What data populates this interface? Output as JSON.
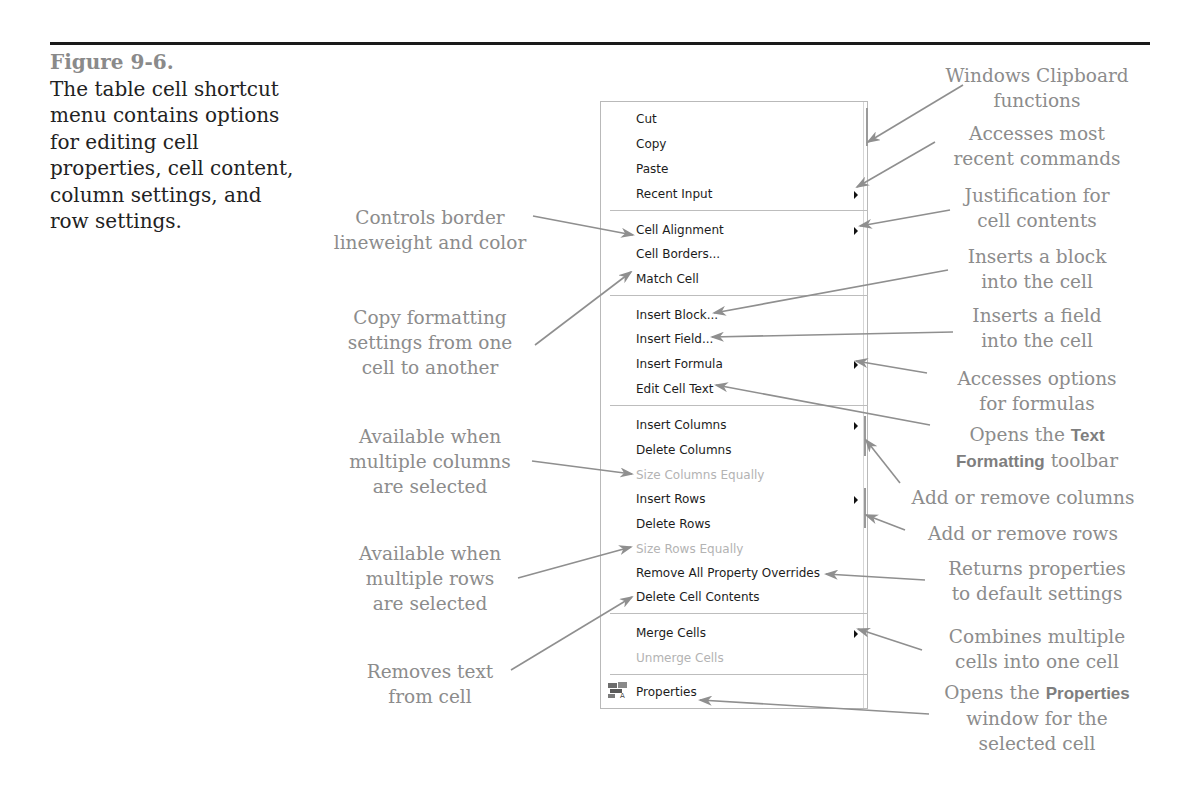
{
  "figure": {
    "label": "Figure 9-6.",
    "caption": "The table cell shortcut menu contains options for editing cell properties, cell content, column settings, and row settings."
  },
  "menu": {
    "items": [
      {
        "label": "Cut",
        "enabled": true,
        "submenu": false
      },
      {
        "label": "Copy",
        "enabled": true,
        "submenu": false
      },
      {
        "label": "Paste",
        "enabled": true,
        "submenu": false
      },
      {
        "label": "Recent Input",
        "enabled": true,
        "submenu": true
      },
      {
        "label": "Cell Alignment",
        "enabled": true,
        "submenu": true
      },
      {
        "label": "Cell Borders...",
        "enabled": true,
        "submenu": false
      },
      {
        "label": "Match Cell",
        "enabled": true,
        "submenu": false
      },
      {
        "label": "Insert Block...",
        "enabled": true,
        "submenu": false
      },
      {
        "label": "Insert Field...",
        "enabled": true,
        "submenu": false
      },
      {
        "label": "Insert Formula",
        "enabled": true,
        "submenu": true
      },
      {
        "label": "Edit Cell Text",
        "enabled": true,
        "submenu": false
      },
      {
        "label": "Insert Columns",
        "enabled": true,
        "submenu": true
      },
      {
        "label": "Delete Columns",
        "enabled": true,
        "submenu": false
      },
      {
        "label": "Size Columns Equally",
        "enabled": false,
        "submenu": false
      },
      {
        "label": "Insert Rows",
        "enabled": true,
        "submenu": true
      },
      {
        "label": "Delete Rows",
        "enabled": true,
        "submenu": false
      },
      {
        "label": "Size Rows Equally",
        "enabled": false,
        "submenu": false
      },
      {
        "label": "Remove All Property Overrides",
        "enabled": true,
        "submenu": false
      },
      {
        "label": "Delete Cell Contents",
        "enabled": true,
        "submenu": false
      },
      {
        "label": "Merge Cells",
        "enabled": true,
        "submenu": true
      },
      {
        "label": "Unmerge Cells",
        "enabled": false,
        "submenu": false
      },
      {
        "label": "Properties",
        "enabled": true,
        "submenu": false,
        "icon": "properties-icon"
      }
    ]
  },
  "annotations_right": {
    "clipboard": {
      "line1": "Windows Clipboard",
      "line2": "functions"
    },
    "recent": {
      "line1": "Accesses most",
      "line2": "recent commands"
    },
    "justification": {
      "line1": "Justification for",
      "line2": "cell contents"
    },
    "block": {
      "line1": "Inserts a block",
      "line2": "into the cell"
    },
    "field": {
      "line1": "Inserts a field",
      "line2": "into the cell"
    },
    "formula": {
      "line1": "Accesses options",
      "line2": "for formulas"
    },
    "textformat": {
      "pre": "Opens the ",
      "bold1": "Text",
      "bold2": "Formatting",
      "post": " toolbar"
    },
    "columns": {
      "line1": "Add or remove columns"
    },
    "rows": {
      "line1": "Add or remove rows"
    },
    "overrides": {
      "line1": "Returns properties",
      "line2": "to default settings"
    },
    "merge": {
      "line1": "Combines multiple",
      "line2": "cells into one cell"
    },
    "properties": {
      "pre": "Opens the ",
      "bold": "Properties",
      "line2": "window for the",
      "line3": "selected cell"
    }
  },
  "annotations_left": {
    "borders": {
      "line1": "Controls border",
      "line2": "lineweight and color"
    },
    "match": {
      "line1": "Copy formatting",
      "line2": "settings from one",
      "line3": "cell to another"
    },
    "sizecols": {
      "line1": "Available when",
      "line2": "multiple columns",
      "line3": "are selected"
    },
    "sizerows": {
      "line1": "Available when",
      "line2": "multiple rows",
      "line3": "are selected"
    },
    "delete": {
      "line1": "Removes text",
      "line2": "from cell"
    }
  },
  "colors": {
    "annotation": "#8c8c8c",
    "arrow": "#8f8f8f",
    "menu_border": "#b9b9b9",
    "disabled": "#b3b3b3"
  }
}
